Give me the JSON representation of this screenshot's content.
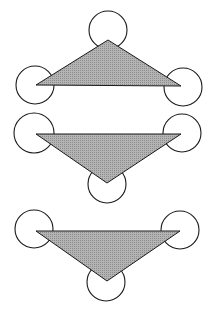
{
  "canvas": {
    "width": 213,
    "height": 322,
    "background": "#ffffff"
  },
  "style": {
    "stroke": "#1a1a1a",
    "fill": "#a8a8a8",
    "circle_fill": "#ffffff"
  },
  "figures": [
    {
      "name": "figure-upward-triangle",
      "triangle": [
        [
          108,
          40
        ],
        [
          36,
          85
        ],
        [
          181,
          86
        ]
      ],
      "circles": [
        {
          "cx": 108,
          "cy": 30,
          "r": 19
        },
        {
          "cx": 35,
          "cy": 85,
          "r": 19
        },
        {
          "cx": 183,
          "cy": 87,
          "r": 19
        }
      ]
    },
    {
      "name": "figure-downward-triangle-middle",
      "triangle": [
        [
          36,
          134
        ],
        [
          181,
          134
        ],
        [
          107,
          183
        ]
      ],
      "circles": [
        {
          "cx": 34,
          "cy": 133,
          "r": 20
        },
        {
          "cx": 182,
          "cy": 133,
          "r": 19
        },
        {
          "cx": 107,
          "cy": 184,
          "r": 19
        }
      ]
    },
    {
      "name": "figure-downward-triangle-bottom",
      "triangle": [
        [
          36,
          231
        ],
        [
          180,
          231
        ],
        [
          107,
          281
        ]
      ],
      "circles": [
        {
          "cx": 34,
          "cy": 229,
          "r": 19
        },
        {
          "cx": 180,
          "cy": 230,
          "r": 19
        },
        {
          "cx": 106,
          "cy": 282,
          "r": 19
        }
      ]
    }
  ]
}
